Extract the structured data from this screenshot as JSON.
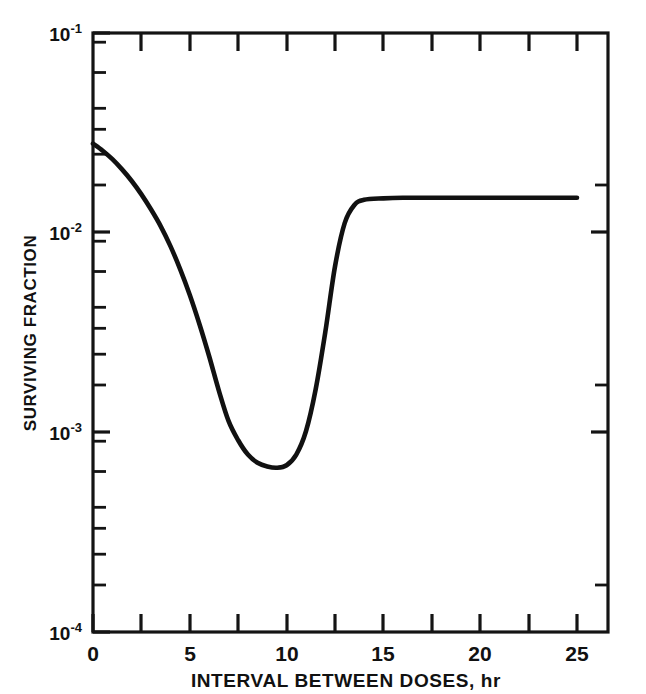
{
  "chart_data": {
    "type": "line",
    "title": "",
    "xlabel": "INTERVAL BETWEEN DOSES, hr",
    "ylabel": "SURVIVING FRACTION",
    "yscale": "log",
    "xscale": "linear",
    "xlim": [
      0,
      26.6
    ],
    "ylim": [
      0.0001,
      0.1
    ],
    "grid": false,
    "legend": null,
    "x_ticks_major": [
      0,
      5,
      10,
      15,
      20,
      25
    ],
    "x_tick_labels": [
      "0",
      "5",
      "10",
      "15",
      "20",
      "25"
    ],
    "x_ticks_minor": [
      2.5,
      7.5,
      12.5,
      17.5,
      22.5
    ],
    "y_ticks_major": [
      0.1,
      0.01,
      0.001,
      0.0001
    ],
    "y_tick_labels": [
      "10-1",
      "10-2",
      "10-3",
      "10-4"
    ],
    "y_tick_mantissa": [
      "10",
      "10",
      "10",
      "10"
    ],
    "y_tick_exponent": [
      "-1",
      "-2",
      "-3",
      "-4"
    ],
    "series": [
      {
        "name": "surviving fraction",
        "x": [
          0,
          0.5,
          1,
          1.5,
          2,
          2.5,
          3,
          3.5,
          4,
          4.5,
          5,
          5.5,
          6,
          6.5,
          7,
          7.5,
          8,
          8.5,
          9,
          9.5,
          10,
          10.5,
          11,
          11.5,
          12,
          12.5,
          13,
          13.5,
          14,
          15,
          16,
          18,
          20,
          22,
          25
        ],
        "y": [
          0.028,
          0.0258,
          0.0234,
          0.0208,
          0.0182,
          0.0156,
          0.0131,
          0.0108,
          0.0086,
          0.0066,
          0.0049,
          0.0035,
          0.00242,
          0.00163,
          0.00115,
          0.00092,
          0.00078,
          0.00071,
          0.00068,
          0.00067,
          0.00069,
          0.00078,
          0.00102,
          0.00165,
          0.0032,
          0.0068,
          0.0112,
          0.0138,
          0.01465,
          0.0149,
          0.015,
          0.015,
          0.015,
          0.015,
          0.015
        ]
      }
    ],
    "annotations": {
      "curve_start_value": "2.8e-2",
      "curve_minimum_value": "6.7e-4",
      "curve_minimum_x": "9.5",
      "curve_plateau_value": "1.5e-2",
      "curve_end_x": "25"
    }
  }
}
